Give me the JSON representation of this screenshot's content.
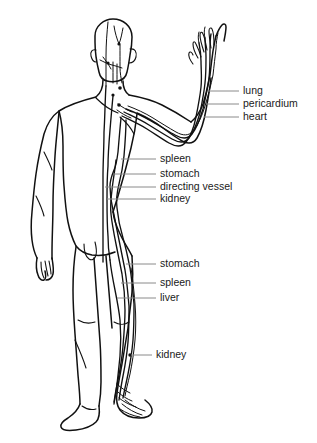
{
  "diagram": {
    "background_color": "#ffffff",
    "line_color": "#111111",
    "leader_line_color": "#8a8a8a",
    "text_color": "#1a1a1a"
  },
  "label_groups": [
    {
      "name": "upper-arm-group",
      "labels": [
        {
          "text": "lung",
          "x": 243,
          "y": 91,
          "leader_x1": 208,
          "leader_x2": 239
        },
        {
          "text": "pericardium",
          "x": 243,
          "y": 104,
          "leader_x1": 206,
          "leader_x2": 239
        },
        {
          "text": "heart",
          "x": 243,
          "y": 117,
          "leader_x1": 204,
          "leader_x2": 239
        }
      ]
    },
    {
      "name": "upper-torso-group",
      "labels": [
        {
          "text": "spleen",
          "x": 160,
          "y": 159,
          "leader_x1": 121,
          "leader_x2": 156
        },
        {
          "text": "stomach",
          "x": 160,
          "y": 174,
          "leader_x1": 114,
          "leader_x2": 156
        },
        {
          "text": "directing vessel",
          "x": 160,
          "y": 187,
          "leader_x1": 105,
          "leader_x2": 156
        },
        {
          "text": "kidney",
          "x": 160,
          "y": 199,
          "leader_x1": 107,
          "leader_x2": 156
        }
      ]
    },
    {
      "name": "lower-torso-group",
      "labels": [
        {
          "text": "stomach",
          "x": 160,
          "y": 264,
          "leader_x1": 126,
          "leader_x2": 156
        },
        {
          "text": "spleen",
          "x": 160,
          "y": 283,
          "leader_x1": 121,
          "leader_x2": 156
        },
        {
          "text": "liver",
          "x": 160,
          "y": 298,
          "leader_x1": 117,
          "leader_x2": 156
        }
      ]
    },
    {
      "name": "leg-group",
      "labels": [
        {
          "text": "kidney",
          "x": 156,
          "y": 355,
          "leader_x1": 131,
          "leader_x2": 152
        }
      ]
    }
  ],
  "meridian_names": [
    "lung",
    "pericardium",
    "heart",
    "spleen",
    "stomach",
    "directing vessel",
    "kidney",
    "liver"
  ]
}
